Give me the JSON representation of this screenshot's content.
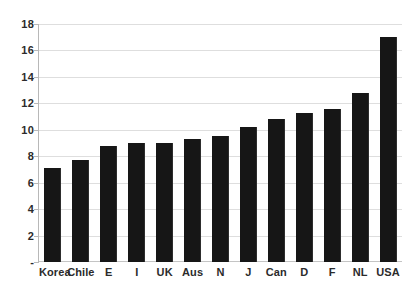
{
  "chart_data": {
    "type": "bar",
    "title": "",
    "subtitle": "",
    "xlabel": "",
    "ylabel": "",
    "categories": [
      "Korea",
      "Chile",
      "E",
      "I",
      "UK",
      "Aus",
      "N",
      "J",
      "Can",
      "D",
      "F",
      "NL",
      "USA"
    ],
    "values": [
      7.1,
      7.7,
      8.8,
      9.0,
      9.0,
      9.3,
      9.5,
      10.2,
      10.8,
      11.3,
      11.6,
      12.8,
      17.0
    ],
    "ylim": [
      0,
      18
    ],
    "ytick_values": [
      18,
      16,
      14,
      12,
      10,
      8,
      6,
      4,
      2,
      0
    ],
    "ytick_labels": [
      "18",
      "16",
      "14",
      "12",
      "10",
      "8",
      "6",
      "4",
      "2",
      "-"
    ],
    "grid": true,
    "legend": null,
    "legend_position": "none",
    "bar_color": "#161616",
    "gridline_color": "#dedede",
    "axis_color": "#b8b8b8",
    "background_color": "#ffffff",
    "text_color": "#2b2b2b"
  }
}
